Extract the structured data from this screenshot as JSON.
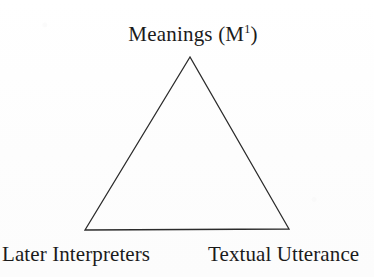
{
  "figure": {
    "name": "semiotic-triangle",
    "background_color": "#fefefe",
    "stroke_color": "#2b2b2b",
    "text_color": "#1b1b1b"
  },
  "diagram": {
    "type": "triangle",
    "vertices": [
      {
        "id": "apex",
        "x": 190,
        "y": 57,
        "label_ref": "apex"
      },
      {
        "id": "bottom-left",
        "x": 85,
        "y": 230,
        "label_ref": "bottom_left"
      },
      {
        "id": "bottom-right",
        "x": 289,
        "y": 229,
        "label_ref": "bottom_right"
      }
    ],
    "edges": [
      {
        "from": "apex",
        "to": "bottom-right"
      },
      {
        "from": "bottom-right",
        "to": "bottom-left"
      },
      {
        "from": "bottom-left",
        "to": "apex"
      }
    ],
    "stroke_width": 1.3,
    "filled": false
  },
  "labels": {
    "apex": {
      "text_before": "Meanings (M",
      "superscript": "1",
      "text_after": ")",
      "full_text": "Meanings (M1)"
    },
    "bottom_left": {
      "full_text": "Later Interpreters"
    },
    "bottom_right": {
      "full_text": "Textual Utterance"
    }
  }
}
